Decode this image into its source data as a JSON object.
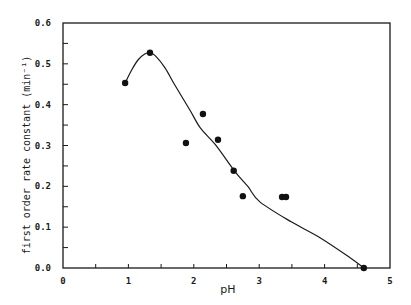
{
  "chart_data": {
    "type": "scatter",
    "title": "",
    "xlabel": "pH",
    "ylabel": "first order rate constant (min⁻¹)",
    "xlim": [
      0,
      5
    ],
    "ylim": [
      0.0,
      0.6
    ],
    "x_ticks": [
      "0",
      "1",
      "2",
      "3",
      "4",
      "5"
    ],
    "y_ticks": [
      "0.0",
      "0.1",
      "0.2",
      "0.3",
      "0.4",
      "0.5",
      "0.6"
    ],
    "grid": false,
    "legend": null,
    "series": [
      {
        "name": "measured",
        "style": "filled-circle",
        "x": [
          0.95,
          1.33,
          1.88,
          2.14,
          2.37,
          2.61,
          2.75,
          3.35,
          3.41,
          4.6
        ],
        "y": [
          0.453,
          0.527,
          0.306,
          0.377,
          0.314,
          0.238,
          0.176,
          0.174,
          0.174,
          0.0
        ]
      },
      {
        "name": "fitted curve",
        "style": "line",
        "x": [
          0.95,
          1.05,
          1.15,
          1.25,
          1.33,
          1.41,
          1.56,
          1.71,
          1.94,
          2.1,
          2.33,
          2.63,
          2.83,
          3.01,
          3.49,
          3.93,
          4.39,
          4.6
        ],
        "y": [
          0.453,
          0.485,
          0.51,
          0.524,
          0.527,
          0.52,
          0.49,
          0.448,
          0.387,
          0.343,
          0.302,
          0.236,
          0.199,
          0.162,
          0.113,
          0.074,
          0.025,
          0.0
        ]
      }
    ]
  }
}
